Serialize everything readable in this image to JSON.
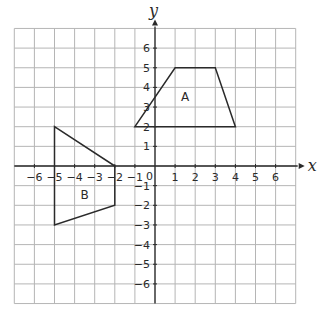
{
  "diagram": {
    "type": "coordinate-grid",
    "x_axis": {
      "label": "x",
      "min": -7,
      "max": 7,
      "ticks": [
        "−6",
        "−5",
        "−4",
        "−3",
        "−2",
        "−1",
        "1",
        "2",
        "3",
        "4",
        "5",
        "6"
      ],
      "tick_values": [
        -6,
        -5,
        -4,
        -3,
        -2,
        -1,
        1,
        2,
        3,
        4,
        5,
        6
      ]
    },
    "y_axis": {
      "label": "y",
      "min": -7,
      "max": 7,
      "ticks": [
        "6",
        "5",
        "4",
        "3",
        "2",
        "1",
        "−1",
        "−2",
        "−3",
        "−4",
        "−5",
        "−6"
      ],
      "tick_values": [
        6,
        5,
        4,
        3,
        2,
        1,
        -1,
        -2,
        -3,
        -4,
        -5,
        -6
      ]
    },
    "origin_label": "0",
    "shapes": [
      {
        "name": "A",
        "label": "A",
        "vertices": [
          [
            -1,
            2
          ],
          [
            1,
            5
          ],
          [
            3,
            5
          ],
          [
            4,
            2
          ]
        ],
        "label_pos": [
          1.5,
          3.5
        ]
      },
      {
        "name": "B",
        "label": "B",
        "vertices": [
          [
            -5,
            2
          ],
          [
            -2,
            0
          ],
          [
            -2,
            -2
          ],
          [
            -5,
            -3
          ]
        ],
        "label_pos": [
          -3.5,
          -1.5
        ]
      }
    ],
    "colors": {
      "grid": "#b5b5b5",
      "axis": "#2a2a2a",
      "shape": "#2a2a2a"
    }
  }
}
